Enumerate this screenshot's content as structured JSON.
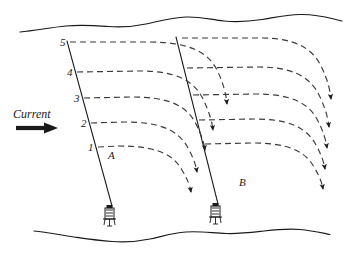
{
  "figure": {
    "type": "oceanographic-current-diagram",
    "background_color": "#ffffff",
    "line_color": "#1a1a1a",
    "dash_color": "#3a3a3a"
  },
  "annotations": {
    "current_label": "Current",
    "current_arrow_icon": "right-arrow-icon",
    "point_a": "A",
    "point_b": "B"
  },
  "depth_marks": [
    {
      "label": "5",
      "value": 5
    },
    {
      "label": "4",
      "value": 4
    },
    {
      "label": "3",
      "value": 3
    },
    {
      "label": "2",
      "value": 2
    },
    {
      "label": "1",
      "value": 1
    }
  ],
  "surface": {
    "name": "water-surface-wavy-line"
  },
  "seabed": {
    "name": "seabed-wavy-line"
  },
  "moorings": [
    {
      "name": "mooring-line-a",
      "anchor_icon": "anchor-figure-icon"
    },
    {
      "name": "mooring-line-b",
      "anchor_icon": "anchor-figure-icon"
    }
  ],
  "flow_paths": {
    "count_left_segment": 5,
    "count_right_segment": 5,
    "arrowhead_icon": "arrowhead-icon"
  }
}
